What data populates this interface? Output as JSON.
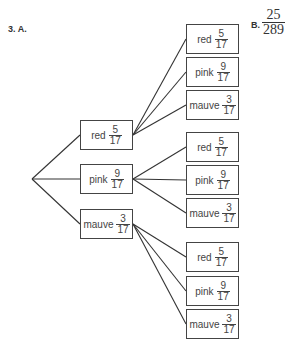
{
  "question": {
    "label": "3. A.",
    "answer_b_label": "B.",
    "answer_b_fraction": {
      "numerator": "25",
      "denominator": "289"
    }
  },
  "colors": {
    "line": "#333333",
    "border": "#444444",
    "text": "#444444"
  },
  "tree": {
    "root": {
      "x": 32,
      "y": 179
    },
    "level1": [
      {
        "label": "red",
        "numerator": "5",
        "denominator": "17",
        "x": 80,
        "y": 120
      },
      {
        "label": "pink",
        "numerator": "9",
        "denominator": "17",
        "x": 80,
        "y": 164
      },
      {
        "label": "mauve",
        "numerator": "3",
        "denominator": "17",
        "x": 80,
        "y": 209
      }
    ],
    "level2": [
      [
        {
          "label": "red",
          "numerator": "5",
          "denominator": "17",
          "x": 186,
          "y": 24
        },
        {
          "label": "pink",
          "numerator": "9",
          "denominator": "17",
          "x": 186,
          "y": 57
        },
        {
          "label": "mauve",
          "numerator": "3",
          "denominator": "17",
          "x": 186,
          "y": 90
        }
      ],
      [
        {
          "label": "red",
          "numerator": "5",
          "denominator": "17",
          "x": 186,
          "y": 132
        },
        {
          "label": "pink",
          "numerator": "9",
          "denominator": "17",
          "x": 186,
          "y": 165
        },
        {
          "label": "mauve",
          "numerator": "3",
          "denominator": "17",
          "x": 186,
          "y": 198
        }
      ],
      [
        {
          "label": "red",
          "numerator": "5",
          "denominator": "17",
          "x": 186,
          "y": 242
        },
        {
          "label": "pink",
          "numerator": "9",
          "denominator": "17",
          "x": 186,
          "y": 276
        },
        {
          "label": "mauve",
          "numerator": "3",
          "denominator": "17",
          "x": 186,
          "y": 309
        }
      ]
    ]
  }
}
